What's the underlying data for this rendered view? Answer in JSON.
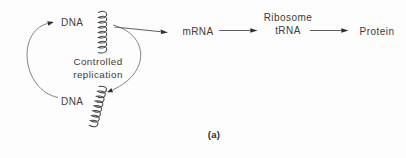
{
  "figure": {
    "caption": "(a)",
    "background_color": "#fdfdfd",
    "text_color": "#3b3b3b",
    "line_color": "#757575"
  },
  "cycle": {
    "top_node_label": "DNA",
    "bottom_node_label": "DNA",
    "center_label": "Controlled\nreplication"
  },
  "pathway": {
    "node_mrna": "mRNA",
    "node_ribosome_trna": "Ribosome\ntRNA",
    "node_protein": "Protein"
  }
}
